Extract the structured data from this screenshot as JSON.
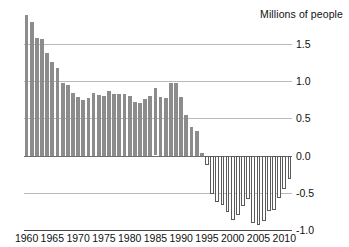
{
  "chart_data": {
    "type": "bar",
    "title": "Millions of people",
    "xlabel": "",
    "ylabel": "Millions of people",
    "ylim": [
      -1.0,
      1.9
    ],
    "xlim": [
      1959.5,
      2011.5
    ],
    "grid": true,
    "legend": "none",
    "yticks": [
      "1.5",
      "1.0",
      "0.5",
      "0.0",
      "-0.5",
      "-1.0"
    ],
    "ytick_values": [
      1.5,
      1.0,
      0.5,
      0.0,
      -0.5,
      -1.0
    ],
    "xticks": [
      "1960",
      "1965",
      "1970",
      "1975",
      "1980",
      "1985",
      "1990",
      "1995",
      "2000",
      "2005",
      "2010"
    ],
    "xtick_values": [
      1960,
      1965,
      1970,
      1975,
      1980,
      1985,
      1990,
      1995,
      2000,
      2005,
      2010
    ],
    "colors": {
      "positive_bar": "#8c8c8c",
      "negative_bar_fill": "#ffffff",
      "negative_bar_stroke": "#5a5a5a",
      "gridline": "#b9b9b9",
      "zero_line": "#6f6f6f",
      "axis": "#4a4a4a",
      "text": "#111111",
      "background": "#ffffff"
    },
    "x": [
      1960,
      1961,
      1962,
      1963,
      1964,
      1965,
      1966,
      1967,
      1968,
      1969,
      1970,
      1971,
      1972,
      1973,
      1974,
      1975,
      1976,
      1977,
      1978,
      1979,
      1980,
      1981,
      1982,
      1983,
      1984,
      1985,
      1986,
      1987,
      1988,
      1989,
      1990,
      1991,
      1992,
      1993,
      1994,
      1995,
      1996,
      1997,
      1998,
      1999,
      2000,
      2001,
      2002,
      2003,
      2004,
      2005,
      2006,
      2007,
      2008,
      2009,
      2010,
      2011
    ],
    "values": [
      1.88,
      1.79,
      1.58,
      1.56,
      1.37,
      1.26,
      1.18,
      0.98,
      0.95,
      0.84,
      0.78,
      0.75,
      0.77,
      0.84,
      0.81,
      0.8,
      0.86,
      0.82,
      0.82,
      0.82,
      0.8,
      0.72,
      0.71,
      0.76,
      0.8,
      0.9,
      0.79,
      0.77,
      0.98,
      0.97,
      0.78,
      0.55,
      0.38,
      0.33,
      0.04,
      -0.13,
      -0.52,
      -0.62,
      -0.66,
      -0.76,
      -0.86,
      -0.8,
      -0.68,
      -0.58,
      -0.9,
      -0.93,
      -0.88,
      -0.74,
      -0.73,
      -0.57,
      -0.45,
      -0.32
    ],
    "series_note": "Bars above zero shown in solid gray; bars below zero shown as white bars with dark outline."
  }
}
